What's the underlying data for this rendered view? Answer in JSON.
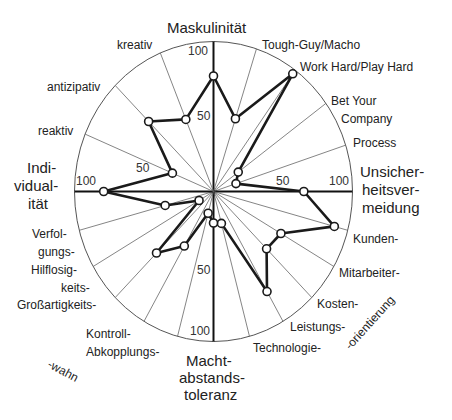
{
  "chart_data": {
    "type": "radar",
    "title": "",
    "range": [
      0,
      100
    ],
    "rings": [
      50,
      100
    ],
    "main_axes": {
      "top": "Maskulinität",
      "right": [
        "Unsicher-",
        "heitsver-",
        "meidung"
      ],
      "bottom": [
        "Macht-",
        "abstands-",
        "toleranz"
      ],
      "left": [
        "Indi-",
        "vidual-",
        "ität"
      ]
    },
    "group_labels": {
      "left_bottom_suffix": "-wahn",
      "right_bottom_suffix": "-orientierung"
    },
    "axes": [
      {
        "name": "Maskulinität",
        "angle": 0,
        "value": 77
      },
      {
        "name": "Tough-Guy/Macho",
        "angle": 18,
        "value": 51
      },
      {
        "name": "Work Hard/Play Hard",
        "angle": 36,
        "value": 97
      },
      {
        "name": "Bet Your Company",
        "angle": 54,
        "value": 22
      },
      {
        "name": "Process",
        "angle": 72,
        "value": 17
      },
      {
        "name": "Unsicherheitsvermeidung",
        "angle": 90,
        "value": 65
      },
      {
        "name": "Kunden-",
        "angle": 105,
        "value": 90
      },
      {
        "name": "Mitarbeiter-",
        "angle": 120,
        "value": 56
      },
      {
        "name": "Kosten-",
        "angle": 135,
        "value": 54
      },
      {
        "name": "Leistungs-",
        "angle": 150,
        "value": 77
      },
      {
        "name": "Technologie-",
        "angle": 165,
        "value": 22
      },
      {
        "name": "Machtabstandstoleranz",
        "angle": 180,
        "value": 21
      },
      {
        "name": "Abkopplungs-",
        "angle": 195,
        "value": 15
      },
      {
        "name": "Kontroll-",
        "angle": 210,
        "value": 42
      },
      {
        "name": "Großartigkeits-",
        "angle": 225,
        "value": 58
      },
      {
        "name": "Hilflosigkeits-",
        "angle": 240,
        "value": 12
      },
      {
        "name": "Verfolgungs-",
        "angle": 255,
        "value": 36
      },
      {
        "name": "Individualität",
        "angle": 270,
        "value": 79
      },
      {
        "name": "reaktiv",
        "angle": 292.5,
        "value": 32
      },
      {
        "name": "antizipativ",
        "angle": 315,
        "value": 66
      },
      {
        "name": "kreativ",
        "angle": 337.5,
        "value": 52
      }
    ]
  },
  "labels": {
    "mask": "Maskulinität",
    "tough": "Tough-Guy/Macho",
    "work": "Work Hard/Play Hard",
    "bet1": "Bet Your",
    "bet2": "Company",
    "process": "Process",
    "unsich1": "Unsicher-",
    "unsich2": "heitsver-",
    "unsich3": "meidung",
    "kunden": "Kunden-",
    "mitarb": "Mitarbeiter-",
    "kosten": "Kosten-",
    "leist": "Leistungs-",
    "techn": "Technologie-",
    "orient": "-orientierung",
    "macht1": "Macht-",
    "macht2": "abstands-",
    "macht3": "toleranz",
    "abkopp": "Abkopplungs-",
    "kontroll": "Kontroll-",
    "wahn": "-wahn",
    "gross": "Großartigkeits-",
    "keits": "keits-",
    "hilf": "Hilflosig-",
    "verf2": "gungs-",
    "verf1": "Verfol-",
    "indiv1": "Indi-",
    "indiv2": "vidual-",
    "indiv3": "ität",
    "reaktiv": "reaktiv",
    "antiz": "antizipativ",
    "kreativ": "kreativ"
  },
  "ticks": {
    "top100": "100",
    "top50": "50",
    "right50": "50",
    "right100": "100",
    "bottom50": "50",
    "bottom100": "100",
    "left50": "50",
    "left100": "100"
  }
}
